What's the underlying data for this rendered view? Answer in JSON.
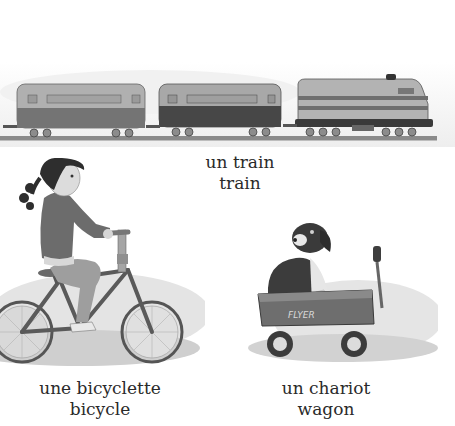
{
  "page": {
    "background": "#ffffff",
    "text_color": "#2a2a2a"
  },
  "items": [
    {
      "id": "train",
      "french": "un train",
      "english": "train",
      "illustration": "train-illustration"
    },
    {
      "id": "bicycle",
      "french": "une bicyclette",
      "english": "bicycle",
      "illustration": "girl-riding-bicycle-illustration"
    },
    {
      "id": "wagon",
      "french": "un chariot",
      "english": "wagon",
      "illustration": "dog-in-wagon-illustration",
      "wagon_text": "FLYER"
    }
  ]
}
